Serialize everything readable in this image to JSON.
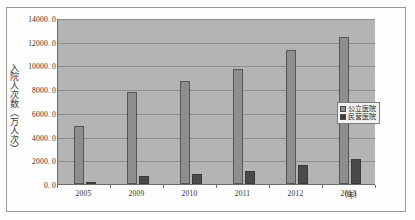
{
  "page": {
    "top_sliver_text": "· · ·  · ·· ·  ·· ·",
    "unit_label": "（年）"
  },
  "legend": {
    "items": [
      {
        "label": "公立医院",
        "color": "#8e8e8e",
        "swatch": "public"
      },
      {
        "label": "民营医院",
        "color": "#3d3d3d",
        "swatch": "private"
      }
    ]
  },
  "chart_data": {
    "type": "bar",
    "title": "",
    "xlabel": "（年）",
    "ylabel": "入院人次数（万人次）",
    "categories": [
      "2005",
      "2009",
      "2010",
      "2011",
      "2012",
      "2013"
    ],
    "series": [
      {
        "name": "公立医院",
        "color": "#8e8e8e",
        "values": [
          4900.0,
          7800.0,
          8700.0,
          9700.0,
          11300.0,
          12400.0
        ]
      },
      {
        "name": "民营医院",
        "color": "#3d3d3d",
        "values": [
          150.0,
          700.0,
          850.0,
          1100.0,
          1600.0,
          2100.0
        ]
      }
    ],
    "ylim": [
      0.0,
      14000.0
    ],
    "ytick_labels": [
      "14000. 0",
      "12000. 0",
      "10000. 0",
      "8000. 0",
      "6000. 0",
      "4000. 0",
      "2000. 0",
      "0. 0"
    ],
    "ytick_values": [
      14000,
      12000,
      10000,
      8000,
      6000,
      4000,
      2000,
      0
    ],
    "grid": true,
    "legend_position": "right-middle"
  }
}
